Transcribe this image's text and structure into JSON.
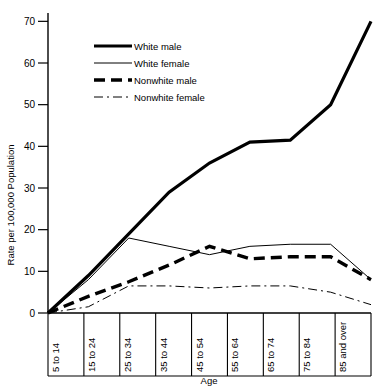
{
  "chart_data": {
    "type": "line",
    "title": "",
    "xlabel": "Age",
    "ylabel": "Rate per 100,000 Population",
    "categories": [
      "5 to 14",
      "15 to 24",
      "25 to 34",
      "35 to 44",
      "45 to 54",
      "55 to 64",
      "65 to 74",
      "75 to 84",
      "85 and over"
    ],
    "yticks": [
      0,
      10,
      20,
      30,
      40,
      50,
      60,
      70
    ],
    "ylim": [
      0,
      72
    ],
    "grid": false,
    "legend_position": "upper-left-inside",
    "series": [
      {
        "name": "White male",
        "style": "thick-solid",
        "values": [
          0,
          9,
          19,
          29,
          36,
          41,
          41.5,
          50,
          70
        ]
      },
      {
        "name": "White female",
        "style": "thin-solid",
        "values": [
          0,
          8,
          18,
          16,
          14,
          16,
          16.5,
          16.5,
          8
        ]
      },
      {
        "name": "Nonwhite male",
        "style": "thick-dashed",
        "values": [
          0,
          4,
          7.5,
          11.5,
          16,
          13,
          13.5,
          13.5,
          8
        ]
      },
      {
        "name": "Nonwhite female",
        "style": "thin-dashdot",
        "values": [
          0,
          1.5,
          6.5,
          6.5,
          6,
          6.5,
          6.5,
          5,
          2
        ]
      }
    ]
  },
  "axes": {
    "ylabel": "Rate per 100,000 Population",
    "xlabel": "Age",
    "ytick_labels": [
      "70",
      "60",
      "50",
      "40",
      "30",
      "20",
      "10",
      "0"
    ],
    "xtick_labels": [
      "5 to 14",
      "15 to 24",
      "25 to 34",
      "35 to 44",
      "45 to 54",
      "55 to 64",
      "65 to 74",
      "75 to 84",
      "85 and over"
    ]
  },
  "legend": {
    "items": [
      {
        "label": "White male",
        "key": "white-male"
      },
      {
        "label": "White female",
        "key": "white-female"
      },
      {
        "label": "Nonwhite male",
        "key": "nonwhite-male"
      },
      {
        "label": "Nonwhite female",
        "key": "nonwhite-female"
      }
    ]
  },
  "colors": {
    "ink": "#000000",
    "background": "#ffffff"
  }
}
